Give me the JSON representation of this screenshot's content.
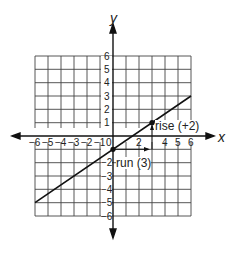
{
  "diagram": {
    "type": "coordinate-plane",
    "axes": {
      "x_label": "x",
      "y_label": "y",
      "range": [
        -6,
        6
      ]
    },
    "x_ticks": [
      "−6",
      "−5",
      "−4",
      "−3",
      "−2",
      "−1",
      "0",
      "2",
      "4",
      "5",
      "6"
    ],
    "y_ticks": [
      "6",
      "5",
      "4",
      "3",
      "2",
      "1",
      "−2",
      "−3",
      "−4",
      "−5",
      "−6"
    ],
    "line": {
      "from": [
        -6,
        -5
      ],
      "to": [
        6,
        3
      ],
      "slope": "2/3"
    },
    "points": [
      [
        0,
        -1
      ],
      [
        3,
        1
      ]
    ],
    "annotations": {
      "rise": "rise (+2)",
      "run": "run (3)"
    }
  }
}
